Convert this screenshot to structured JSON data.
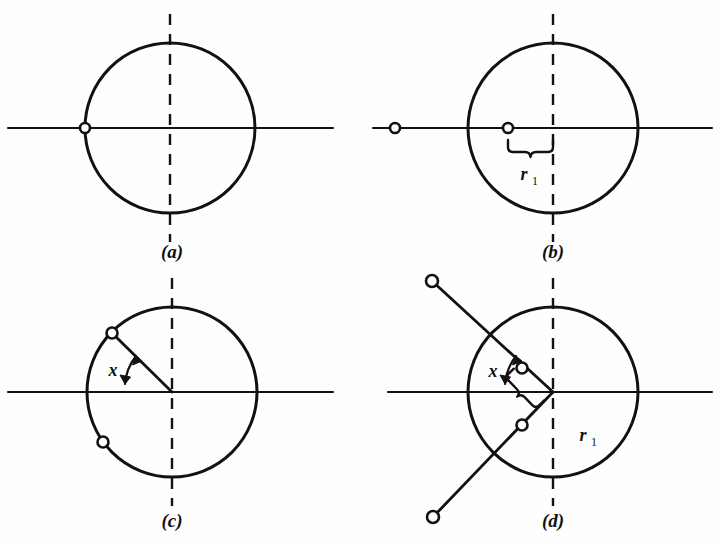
{
  "figure": {
    "background_color": "#fefefe",
    "ink_color": "#111111",
    "width": 720,
    "height": 548,
    "panels": [
      {
        "id": "a",
        "label": "(a)",
        "label_x": 172,
        "label_y": 258,
        "circle": {
          "cx": 170,
          "cy": 128,
          "r": 85
        },
        "axis": {
          "x1": 8,
          "y1": 128,
          "x2": 333,
          "y2": 128
        },
        "dashed_axis": {
          "x1": 170,
          "y1": 14,
          "x2": 170,
          "y2": 242
        },
        "markers": [
          {
            "name": "marker-left-intersection",
            "cx": 85,
            "cy": 128,
            "r": 5
          }
        ],
        "radius_line": null,
        "angle_label": null,
        "brace_label": null
      },
      {
        "id": "b",
        "label": "(b)",
        "label_x": 553,
        "label_y": 258,
        "circle": {
          "cx": 553,
          "cy": 128,
          "r": 85
        },
        "axis": {
          "x1": 373,
          "y1": 128,
          "x2": 712,
          "y2": 128
        },
        "dashed_axis": {
          "x1": 553,
          "y1": 14,
          "x2": 553,
          "y2": 242
        },
        "markers": [
          {
            "name": "marker-outer-left",
            "cx": 395,
            "cy": 128,
            "r": 5
          },
          {
            "name": "marker-inner",
            "cx": 508,
            "cy": 128,
            "r": 5
          }
        ],
        "radius_line": null,
        "angle_label": null,
        "brace_label": {
          "text": "r",
          "subscript": "1",
          "from_x": 508,
          "to_x": 553,
          "y": 142,
          "label_x": 530,
          "label_y": 176
        }
      },
      {
        "id": "c",
        "label": "(c)",
        "label_x": 172,
        "label_y": 527,
        "circle": {
          "cx": 172,
          "cy": 392,
          "r": 85
        },
        "axis": {
          "x1": 8,
          "y1": 392,
          "x2": 333,
          "y2": 392
        },
        "dashed_axis": {
          "x1": 172,
          "y1": 278,
          "x2": 172,
          "y2": 506
        },
        "markers": [
          {
            "name": "marker-radius-end",
            "cx": 112,
            "cy": 333,
            "r": 5.5
          },
          {
            "name": "marker-lower-left",
            "cx": 103,
            "cy": 442,
            "r": 5.5
          }
        ],
        "radius_line": {
          "x1": 172,
          "y1": 392,
          "x2": 112,
          "y2": 333
        },
        "angle_label": {
          "text": "x",
          "label_x": 118,
          "label_y": 374,
          "arc_radius": 52,
          "start_deg": 180,
          "end_deg": 135
        },
        "brace_label": null
      },
      {
        "id": "d",
        "label": "(d)",
        "label_x": 553,
        "label_y": 527,
        "circle": {
          "cx": 553,
          "cy": 392,
          "r": 85
        },
        "axis": {
          "x1": 388,
          "y1": 392,
          "x2": 712,
          "y2": 392
        },
        "dashed_axis": {
          "x1": 553,
          "y1": 278,
          "x2": 553,
          "y2": 506
        },
        "markers": [
          {
            "name": "marker-outer-upper-left",
            "cx": 432,
            "cy": 281,
            "r": 6
          },
          {
            "name": "marker-inner-upper",
            "cx": 522,
            "cy": 368,
            "r": 5.5
          },
          {
            "name": "marker-inner-lower",
            "cx": 522,
            "cy": 425,
            "r": 5.5
          },
          {
            "name": "marker-outer-lower-left",
            "cx": 433,
            "cy": 517,
            "r": 6
          }
        ],
        "diagonal_line": {
          "x1": 432,
          "y1": 281,
          "x2": 553,
          "y2": 392
        },
        "diagonal_line_2": {
          "x1": 553,
          "y1": 392,
          "x2": 433,
          "y2": 517
        },
        "angle_label": {
          "text": "x",
          "label_x": 498,
          "label_y": 375,
          "arc_radius": 53,
          "start_deg": 180,
          "end_deg": 137
        },
        "brace_label": {
          "text": "r",
          "subscript": "1",
          "label_x": 588,
          "label_y": 438,
          "rotate_deg": 46,
          "pivot_x": 553,
          "pivot_y": 392,
          "length": 45,
          "offset": 14
        }
      }
    ]
  }
}
